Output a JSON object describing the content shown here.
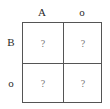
{
  "diagram": {
    "type": "punnett-square",
    "column_headers": [
      "A",
      "o"
    ],
    "row_headers": [
      "B",
      "o"
    ],
    "cells": [
      [
        "?",
        "?"
      ],
      [
        "?",
        "?"
      ]
    ],
    "colors": {
      "grid_line": "#555555",
      "label_text": "#2a2a2a",
      "cell_text": "#777777",
      "background": "#ffffff"
    }
  }
}
